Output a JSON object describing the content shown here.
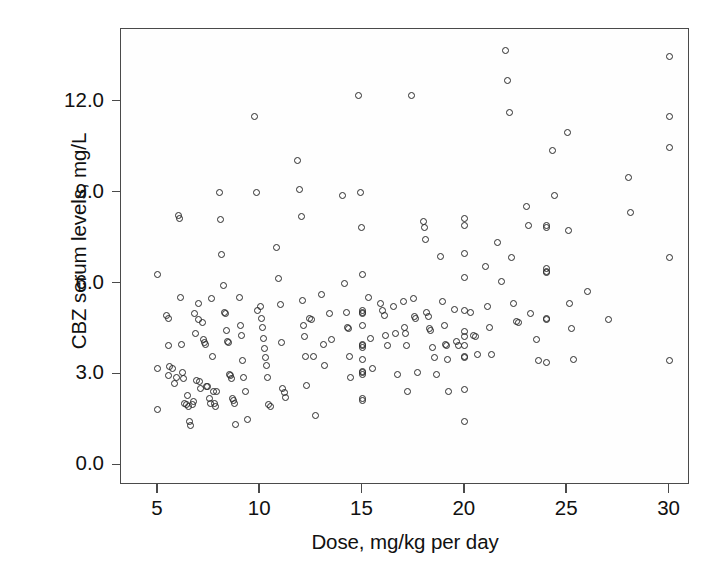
{
  "chart_data": {
    "type": "scatter",
    "title": "",
    "xlabel": "Dose, mg/kg per day",
    "ylabel": "CBZ serum levels, mg/L",
    "xlim": [
      3.2,
      31.0
    ],
    "ylim": [
      -0.65,
      14.4
    ],
    "xticks": [
      5,
      10,
      15,
      20,
      25,
      30
    ],
    "xtick_labels": [
      "5",
      "10",
      "15",
      "20",
      "25",
      "30"
    ],
    "yticks": [
      0.0,
      3.0,
      6.0,
      9.0,
      12.0
    ],
    "ytick_labels": [
      "0.0",
      "3.0",
      "6.0",
      "9.0",
      "12.0"
    ],
    "grid": false,
    "legend": null,
    "marker": "open-circle",
    "marker_color": "#2b2b2b",
    "frame_color": "#4a4a4a",
    "background": "#ffffff",
    "n_points": 236,
    "points": [
      [
        5.0,
        6.3
      ],
      [
        5.0,
        3.2
      ],
      [
        5.0,
        1.85
      ],
      [
        5.4,
        4.95
      ],
      [
        5.5,
        4.85
      ],
      [
        5.5,
        3.95
      ],
      [
        5.5,
        2.95
      ],
      [
        5.55,
        3.25
      ],
      [
        5.7,
        3.2
      ],
      [
        5.8,
        2.7
      ],
      [
        5.9,
        2.9
      ],
      [
        6.0,
        8.25
      ],
      [
        6.05,
        8.15
      ],
      [
        6.1,
        5.55
      ],
      [
        6.15,
        4.0
      ],
      [
        6.2,
        3.05
      ],
      [
        6.25,
        2.85
      ],
      [
        6.3,
        2.05
      ],
      [
        6.4,
        2.0
      ],
      [
        6.45,
        2.3
      ],
      [
        6.5,
        1.95
      ],
      [
        6.55,
        1.45
      ],
      [
        6.6,
        1.3
      ],
      [
        6.7,
        2.0
      ],
      [
        6.75,
        2.1
      ],
      [
        6.8,
        5.0
      ],
      [
        6.85,
        4.35
      ],
      [
        6.9,
        2.8
      ],
      [
        7.0,
        5.35
      ],
      [
        7.0,
        4.8
      ],
      [
        7.05,
        2.75
      ],
      [
        7.1,
        2.55
      ],
      [
        7.2,
        4.7
      ],
      [
        7.25,
        4.15
      ],
      [
        7.3,
        4.05
      ],
      [
        7.35,
        4.0
      ],
      [
        7.4,
        2.6
      ],
      [
        7.45,
        2.6
      ],
      [
        7.5,
        2.2
      ],
      [
        7.55,
        2.05
      ],
      [
        7.6,
        5.5
      ],
      [
        7.65,
        3.6
      ],
      [
        7.7,
        2.45
      ],
      [
        7.75,
        2.05
      ],
      [
        7.8,
        1.95
      ],
      [
        7.85,
        2.45
      ],
      [
        8.0,
        9.0
      ],
      [
        8.05,
        8.1
      ],
      [
        8.1,
        6.95
      ],
      [
        8.2,
        5.95
      ],
      [
        8.25,
        5.05
      ],
      [
        8.3,
        5.0
      ],
      [
        8.35,
        4.45
      ],
      [
        8.4,
        4.1
      ],
      [
        8.45,
        4.05
      ],
      [
        8.5,
        3.0
      ],
      [
        8.55,
        2.95
      ],
      [
        8.6,
        2.85
      ],
      [
        8.65,
        2.2
      ],
      [
        8.7,
        2.15
      ],
      [
        8.75,
        2.05
      ],
      [
        8.8,
        1.35
      ],
      [
        9.0,
        5.55
      ],
      [
        9.05,
        4.6
      ],
      [
        9.1,
        4.3
      ],
      [
        9.15,
        3.45
      ],
      [
        9.2,
        2.9
      ],
      [
        9.3,
        2.45
      ],
      [
        9.4,
        1.5
      ],
      [
        9.7,
        11.5
      ],
      [
        9.8,
        9.0
      ],
      [
        9.85,
        5.1
      ],
      [
        10.0,
        5.25
      ],
      [
        10.05,
        4.85
      ],
      [
        10.1,
        4.55
      ],
      [
        10.15,
        4.2
      ],
      [
        10.2,
        3.85
      ],
      [
        10.25,
        3.55
      ],
      [
        10.3,
        3.3
      ],
      [
        10.35,
        2.9
      ],
      [
        10.4,
        2.0
      ],
      [
        10.5,
        1.95
      ],
      [
        10.8,
        7.2
      ],
      [
        10.9,
        6.15
      ],
      [
        11.0,
        5.3
      ],
      [
        11.05,
        4.05
      ],
      [
        11.1,
        2.55
      ],
      [
        11.2,
        2.4
      ],
      [
        11.25,
        2.25
      ],
      [
        11.8,
        10.05
      ],
      [
        11.9,
        9.1
      ],
      [
        12.0,
        8.2
      ],
      [
        12.05,
        5.45
      ],
      [
        12.1,
        4.6
      ],
      [
        12.15,
        4.25
      ],
      [
        12.2,
        3.6
      ],
      [
        12.25,
        2.65
      ],
      [
        12.4,
        4.85
      ],
      [
        12.5,
        4.8
      ],
      [
        12.6,
        3.6
      ],
      [
        12.7,
        1.65
      ],
      [
        13.0,
        5.65
      ],
      [
        13.1,
        4.0
      ],
      [
        13.15,
        3.3
      ],
      [
        13.4,
        5.0
      ],
      [
        13.5,
        4.15
      ],
      [
        14.0,
        8.9
      ],
      [
        14.1,
        6.0
      ],
      [
        14.2,
        5.05
      ],
      [
        14.25,
        4.55
      ],
      [
        14.3,
        4.5
      ],
      [
        14.35,
        3.6
      ],
      [
        14.4,
        2.9
      ],
      [
        14.8,
        12.2
      ],
      [
        14.9,
        9.0
      ],
      [
        14.95,
        7.85
      ],
      [
        15.0,
        6.3
      ],
      [
        15.0,
        5.1
      ],
      [
        15.0,
        5.05
      ],
      [
        15.0,
        5.0
      ],
      [
        15.0,
        4.6
      ],
      [
        15.0,
        4.0
      ],
      [
        15.0,
        3.95
      ],
      [
        15.0,
        3.9
      ],
      [
        15.0,
        3.5
      ],
      [
        15.0,
        3.1
      ],
      [
        15.0,
        3.05
      ],
      [
        15.0,
        3.0
      ],
      [
        15.0,
        2.2
      ],
      [
        15.0,
        2.15
      ],
      [
        15.3,
        5.55
      ],
      [
        15.4,
        4.2
      ],
      [
        15.5,
        3.2
      ],
      [
        15.9,
        5.35
      ],
      [
        16.0,
        5.1
      ],
      [
        16.05,
        4.95
      ],
      [
        16.1,
        4.3
      ],
      [
        16.2,
        3.95
      ],
      [
        16.5,
        5.25
      ],
      [
        16.6,
        4.35
      ],
      [
        16.7,
        3.0
      ],
      [
        17.0,
        5.4
      ],
      [
        17.05,
        4.55
      ],
      [
        17.1,
        4.35
      ],
      [
        17.15,
        3.95
      ],
      [
        17.2,
        2.45
      ],
      [
        17.4,
        12.2
      ],
      [
        17.5,
        5.5
      ],
      [
        17.55,
        4.9
      ],
      [
        17.6,
        4.85
      ],
      [
        17.7,
        3.05
      ],
      [
        18.0,
        8.05
      ],
      [
        18.05,
        7.85
      ],
      [
        18.1,
        7.45
      ],
      [
        18.15,
        5.05
      ],
      [
        18.2,
        4.9
      ],
      [
        18.25,
        4.5
      ],
      [
        18.3,
        4.45
      ],
      [
        18.4,
        3.9
      ],
      [
        18.5,
        3.55
      ],
      [
        18.6,
        3.0
      ],
      [
        18.8,
        6.9
      ],
      [
        18.9,
        5.4
      ],
      [
        19.0,
        4.6
      ],
      [
        19.05,
        4.0
      ],
      [
        19.1,
        3.95
      ],
      [
        19.15,
        3.5
      ],
      [
        19.2,
        2.45
      ],
      [
        19.5,
        5.15
      ],
      [
        19.6,
        4.1
      ],
      [
        19.7,
        3.95
      ],
      [
        20.0,
        8.15
      ],
      [
        20.0,
        7.9
      ],
      [
        20.0,
        7.0
      ],
      [
        20.0,
        6.2
      ],
      [
        20.0,
        5.1
      ],
      [
        20.0,
        4.4
      ],
      [
        20.0,
        4.25
      ],
      [
        20.0,
        3.95
      ],
      [
        20.0,
        3.6
      ],
      [
        20.0,
        3.55
      ],
      [
        20.0,
        2.5
      ],
      [
        20.0,
        1.45
      ],
      [
        20.3,
        5.05
      ],
      [
        20.4,
        4.3
      ],
      [
        20.5,
        4.25
      ],
      [
        20.6,
        3.65
      ],
      [
        21.0,
        6.55
      ],
      [
        21.1,
        5.25
      ],
      [
        21.2,
        4.55
      ],
      [
        21.3,
        3.65
      ],
      [
        21.6,
        7.35
      ],
      [
        21.8,
        6.05
      ],
      [
        22.0,
        13.7
      ],
      [
        22.1,
        12.7
      ],
      [
        22.2,
        11.65
      ],
      [
        22.3,
        6.85
      ],
      [
        22.4,
        5.35
      ],
      [
        22.5,
        4.75
      ],
      [
        22.6,
        4.7
      ],
      [
        23.0,
        8.55
      ],
      [
        23.1,
        7.9
      ],
      [
        23.2,
        5.0
      ],
      [
        23.5,
        4.15
      ],
      [
        23.6,
        3.45
      ],
      [
        24.0,
        7.9
      ],
      [
        24.0,
        7.85
      ],
      [
        24.0,
        6.5
      ],
      [
        24.0,
        6.4
      ],
      [
        24.0,
        6.35
      ],
      [
        24.0,
        4.85
      ],
      [
        24.0,
        4.8
      ],
      [
        24.0,
        3.4
      ],
      [
        24.3,
        10.4
      ],
      [
        24.4,
        8.9
      ],
      [
        25.0,
        11.0
      ],
      [
        25.05,
        7.75
      ],
      [
        25.1,
        5.35
      ],
      [
        25.2,
        4.5
      ],
      [
        25.3,
        3.5
      ],
      [
        26.0,
        5.75
      ],
      [
        27.0,
        4.8
      ],
      [
        28.0,
        9.5
      ],
      [
        28.1,
        8.35
      ],
      [
        30.0,
        13.5
      ],
      [
        30.0,
        11.5
      ],
      [
        30.0,
        10.5
      ],
      [
        30.0,
        6.85
      ],
      [
        30.0,
        3.45
      ]
    ]
  }
}
